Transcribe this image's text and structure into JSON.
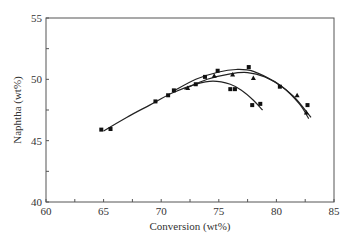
{
  "chart_data": {
    "type": "line",
    "title": "",
    "xlabel": "Conversion (wt%)",
    "ylabel": "Naphtha (wt%)",
    "xlim": [
      60,
      85
    ],
    "ylim": [
      40,
      55
    ],
    "x_ticks": [
      60,
      65,
      70,
      75,
      80,
      85
    ],
    "y_ticks": [
      40,
      45,
      50,
      55
    ],
    "x_minor_step": 2.5,
    "y_minor_step": 2.5,
    "grid": false,
    "legend": null,
    "series": [
      {
        "name": "series-1",
        "marker": "square",
        "fit": "polynomial",
        "points": [
          {
            "x": 64.8,
            "y": 45.9
          },
          {
            "x": 65.6,
            "y": 45.95
          },
          {
            "x": 69.5,
            "y": 48.2
          },
          {
            "x": 70.6,
            "y": 48.7
          },
          {
            "x": 73.0,
            "y": 49.6
          },
          {
            "x": 76.0,
            "y": 49.2
          },
          {
            "x": 76.4,
            "y": 49.2
          },
          {
            "x": 77.9,
            "y": 47.9
          },
          {
            "x": 78.6,
            "y": 48.0
          }
        ],
        "curve": [
          {
            "x": 65.0,
            "y": 45.8
          },
          {
            "x": 67.0,
            "y": 46.9
          },
          {
            "x": 69.0,
            "y": 47.9
          },
          {
            "x": 71.0,
            "y": 48.9
          },
          {
            "x": 73.0,
            "y": 49.6
          },
          {
            "x": 74.5,
            "y": 49.85
          },
          {
            "x": 76.0,
            "y": 49.6
          },
          {
            "x": 77.0,
            "y": 49.1
          },
          {
            "x": 78.0,
            "y": 48.3
          },
          {
            "x": 78.8,
            "y": 47.5
          }
        ]
      },
      {
        "name": "series-2",
        "marker": "square",
        "fit": "polynomial",
        "points": [
          {
            "x": 71.1,
            "y": 49.1
          },
          {
            "x": 73.8,
            "y": 50.2
          },
          {
            "x": 74.9,
            "y": 50.7
          },
          {
            "x": 77.6,
            "y": 51.0
          },
          {
            "x": 80.3,
            "y": 49.4
          },
          {
            "x": 82.7,
            "y": 47.9
          }
        ],
        "curve": [
          {
            "x": 71.0,
            "y": 49.0
          },
          {
            "x": 73.0,
            "y": 50.0
          },
          {
            "x": 75.0,
            "y": 50.6
          },
          {
            "x": 76.5,
            "y": 50.8
          },
          {
            "x": 78.0,
            "y": 50.65
          },
          {
            "x": 80.0,
            "y": 49.7
          },
          {
            "x": 81.5,
            "y": 48.6
          },
          {
            "x": 83.0,
            "y": 46.9
          }
        ]
      },
      {
        "name": "series-3",
        "marker": "triangle",
        "fit": "polynomial",
        "points": [
          {
            "x": 72.3,
            "y": 49.3
          },
          {
            "x": 74.6,
            "y": 50.3
          },
          {
            "x": 76.2,
            "y": 50.4
          },
          {
            "x": 78.0,
            "y": 50.1
          },
          {
            "x": 81.8,
            "y": 48.7
          },
          {
            "x": 82.6,
            "y": 47.3
          }
        ],
        "curve": [
          {
            "x": 72.0,
            "y": 49.2
          },
          {
            "x": 74.0,
            "y": 50.0
          },
          {
            "x": 76.0,
            "y": 50.45
          },
          {
            "x": 77.5,
            "y": 50.55
          },
          {
            "x": 79.0,
            "y": 50.2
          },
          {
            "x": 80.5,
            "y": 49.4
          },
          {
            "x": 82.0,
            "y": 48.0
          },
          {
            "x": 82.8,
            "y": 46.8
          }
        ]
      }
    ]
  }
}
